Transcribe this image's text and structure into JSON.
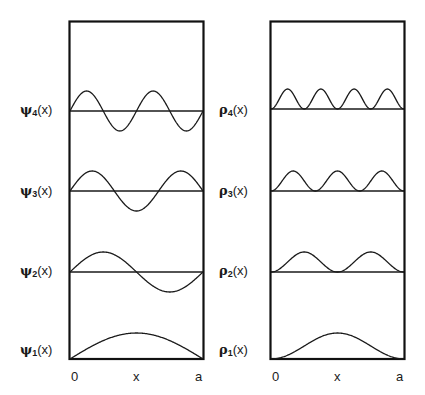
{
  "figure": {
    "left_panel": {
      "title": "Wavefunctions",
      "symbol": "ψ",
      "rows": [
        {
          "label_symbol": "ψ",
          "label_sub": "4",
          "label_arg": "(x)",
          "n": 4
        },
        {
          "label_symbol": "ψ",
          "label_sub": "3",
          "label_arg": "(x)",
          "n": 3
        },
        {
          "label_symbol": "ψ",
          "label_sub": "2",
          "label_arg": "(x)",
          "n": 2
        },
        {
          "label_symbol": "ψ",
          "label_sub": "1",
          "label_arg": "(x)",
          "n": 1
        }
      ],
      "x_ticks": {
        "start": "0",
        "mid": "x",
        "end": "a"
      }
    },
    "right_panel": {
      "title": "Probability densities",
      "symbol": "ρ",
      "rows": [
        {
          "label_symbol": "ρ",
          "label_sub": "4",
          "label_arg": "(x)",
          "n": 4
        },
        {
          "label_symbol": "ρ",
          "label_sub": "3",
          "label_arg": "(x)",
          "n": 3
        },
        {
          "label_symbol": "ρ",
          "label_sub": "2",
          "label_arg": "(x)",
          "n": 2
        },
        {
          "label_symbol": "ρ",
          "label_sub": "1",
          "label_arg": "(x)",
          "n": 1
        }
      ],
      "x_ticks": {
        "start": "0",
        "mid": "x",
        "end": "a"
      }
    },
    "colors": {
      "line": "#1a1a1a",
      "box": "#111111",
      "background": "#ffffff"
    }
  },
  "chart_data": [
    {
      "type": "line",
      "title": "ψn(x) particle-in-a-box wavefunctions",
      "xlabel": "x",
      "x_range": [
        0,
        "a"
      ],
      "series": [
        {
          "name": "ψ4(x)",
          "function": "sin(4πx/a)",
          "baseline_px": 111,
          "amplitude_px": 20
        },
        {
          "name": "ψ3(x)",
          "function": "sin(3πx/a)",
          "baseline_px": 191,
          "amplitude_px": 20
        },
        {
          "name": "ψ2(x)",
          "function": "sin(2πx/a)",
          "baseline_px": 272,
          "amplitude_px": 20
        },
        {
          "name": "ψ1(x)",
          "function": "sin(πx/a)",
          "baseline_px": 359,
          "amplitude_px": 26
        }
      ]
    },
    {
      "type": "line",
      "title": "ρn(x) probability densities",
      "xlabel": "x",
      "x_range": [
        0,
        "a"
      ],
      "series": [
        {
          "name": "ρ4(x)",
          "function": "sin²(4πx/a)",
          "baseline_px": 109,
          "amplitude_px": 20
        },
        {
          "name": "ρ3(x)",
          "function": "sin²(3πx/a)",
          "baseline_px": 191,
          "amplitude_px": 20
        },
        {
          "name": "ρ2(x)",
          "function": "sin²(2πx/a)",
          "baseline_px": 272,
          "amplitude_px": 20
        },
        {
          "name": "ρ1(x)",
          "function": "sin²(πx/a)",
          "baseline_px": 359,
          "amplitude_px": 26
        }
      ]
    }
  ]
}
